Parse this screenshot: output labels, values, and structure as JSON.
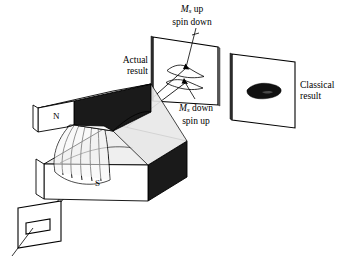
{
  "figure": {
    "title_caption": "",
    "type": "stern-gerlach-apparatus-diagram",
    "background_color": "#ffffff",
    "ink_color": "#000000"
  },
  "labels": {
    "ms_up": {
      "symbol": "M",
      "subscript": "s",
      "word": "up",
      "line2": "spin down",
      "full": "Ms up spin down"
    },
    "ms_down": {
      "symbol": "M",
      "subscript": "s",
      "word": "down",
      "line2": "spin up",
      "full": "Ms down spin up"
    },
    "actual_result": {
      "line1": "Actual",
      "line2": "result"
    },
    "classical_result": {
      "line1": "Classical",
      "line2": "result"
    },
    "north_pole": "N",
    "south_pole": "S"
  },
  "colors": {
    "outline": "#000000",
    "magnet_top_face": "#ffffff",
    "magnet_dark_face": "#1a1a1a",
    "magnet_shaded_face": "#e8e8e8",
    "field_region": "#efefef",
    "screen_face": "#ffffff",
    "blob_fill": "#111111"
  },
  "elements": {
    "upper_magnet_pole": "N",
    "lower_magnet_pole": "S",
    "field_lines_count": 7,
    "beam_count": 2,
    "actual_screen_spots": 2,
    "classical_screen_spots": 1,
    "collimator_slit_shape": "rectangle"
  }
}
